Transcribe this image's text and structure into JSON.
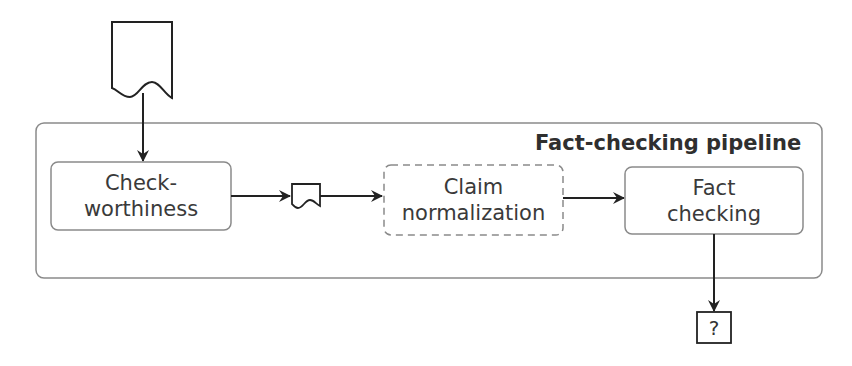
{
  "pipeline": {
    "title": "Fact-checking pipeline",
    "stages": [
      {
        "id": "check-worthiness",
        "line1": "Check-",
        "line2": "worthiness",
        "border": "solid"
      },
      {
        "id": "claim-normalization",
        "line1": "Claim",
        "line2": "normalization",
        "border": "dashed"
      },
      {
        "id": "fact-checking",
        "line1": "Fact",
        "line2": "checking",
        "border": "solid"
      }
    ]
  },
  "input": {
    "icon": "document-icon"
  },
  "intermediate": {
    "icon": "document-icon"
  },
  "output": {
    "symbol": "?"
  },
  "colors": {
    "line": "#2a2a2a",
    "box_border": "#8a8a8a",
    "background": "#ffffff"
  }
}
